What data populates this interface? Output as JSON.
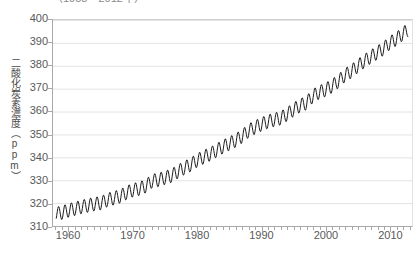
{
  "figure": {
    "title_truncated": "（1958～2012年）",
    "background_color": "#ffffff",
    "line_color": "#1a1a1a",
    "grid_color": "#e3e3e3",
    "axis_color": "#a8a8a8",
    "tick_label_color": "#595959"
  },
  "axes": {
    "ylabel_vertical": "二酸化炭素濃度（ppm）",
    "y_ticks": [
      400,
      390,
      380,
      370,
      360,
      350,
      340,
      330,
      320,
      310
    ],
    "x_ticks": [
      1960,
      1970,
      1980,
      1990,
      2000,
      2010
    ]
  },
  "chart_data": {
    "type": "line",
    "title": "（1958～2012年）",
    "xlabel": "",
    "ylabel": "二酸化炭素濃度（ppm）",
    "xlim": [
      1957.5,
      2013.5
    ],
    "ylim": [
      310,
      400
    ],
    "grid": "horizontal",
    "legend": "none",
    "series_name": "二酸化炭素濃度",
    "seasonal_amplitude_ppm": 6.0,
    "x": [
      1958,
      1959,
      1960,
      1961,
      1962,
      1963,
      1964,
      1965,
      1966,
      1967,
      1968,
      1969,
      1970,
      1971,
      1972,
      1973,
      1974,
      1975,
      1976,
      1977,
      1978,
      1979,
      1980,
      1981,
      1982,
      1983,
      1984,
      1985,
      1986,
      1987,
      1988,
      1989,
      1990,
      1991,
      1992,
      1993,
      1994,
      1995,
      1996,
      1997,
      1998,
      1999,
      2000,
      2001,
      2002,
      2003,
      2004,
      2005,
      2006,
      2007,
      2008,
      2009,
      2010,
      2011,
      2012
    ],
    "values": [
      315.3,
      315.9,
      316.9,
      317.6,
      318.4,
      319.0,
      319.6,
      320.0,
      321.4,
      322.2,
      323.0,
      324.6,
      325.7,
      326.3,
      327.5,
      329.7,
      330.2,
      331.1,
      332.0,
      333.8,
      335.4,
      336.8,
      338.7,
      340.1,
      341.4,
      343.0,
      344.6,
      346.0,
      347.4,
      349.2,
      351.6,
      353.1,
      354.4,
      355.6,
      356.4,
      357.1,
      358.8,
      360.8,
      362.6,
      363.7,
      366.7,
      368.4,
      369.5,
      371.1,
      373.2,
      375.8,
      377.5,
      379.8,
      381.9,
      383.8,
      385.6,
      387.4,
      389.9,
      391.6,
      393.8
    ]
  }
}
